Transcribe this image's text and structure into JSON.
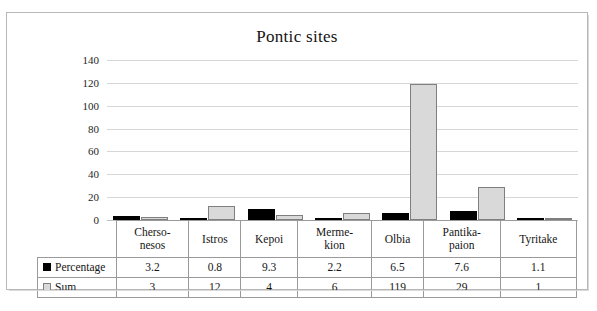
{
  "chart_data": {
    "type": "bar",
    "title": "Pontic sites",
    "xlabel": "",
    "ylabel": "",
    "ylim": [
      0,
      140
    ],
    "yticks": [
      0,
      20,
      40,
      60,
      80,
      100,
      120,
      140
    ],
    "grid": true,
    "legend_position": "table-left",
    "categories": [
      "Cherso-nesos",
      "Istros",
      "Kepoi",
      "Merme-kion",
      "Olbia",
      "Pantika-paion",
      "Tyritake"
    ],
    "category_lines": [
      [
        "Cherso-",
        "nesos"
      ],
      [
        "Istros",
        ""
      ],
      [
        "Kepoi",
        ""
      ],
      [
        "Merme-",
        "kion"
      ],
      [
        "Olbia",
        ""
      ],
      [
        "Pantika-",
        "paion"
      ],
      [
        "Tyritake",
        ""
      ]
    ],
    "series": [
      {
        "name": "Percentage",
        "color": "#000000",
        "values": [
          3.2,
          0.8,
          9.3,
          2.2,
          6.5,
          7.6,
          1.1
        ],
        "labels": [
          "3.2",
          "0.8",
          "9.3",
          "2.2",
          "6.5",
          "7.6",
          "1.1"
        ]
      },
      {
        "name": "Sum",
        "color": "#d9d9d9",
        "values": [
          3,
          12,
          4,
          6,
          119,
          29,
          1
        ],
        "labels": [
          "3",
          "12",
          "4",
          "6",
          "119",
          "29",
          "1"
        ]
      }
    ]
  },
  "table": {
    "row_labels": [
      "Percentage",
      "Sum"
    ]
  },
  "caption": {
    "text": ""
  }
}
